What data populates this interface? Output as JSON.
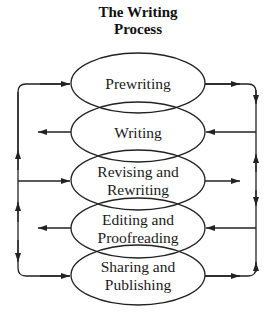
{
  "diagram": {
    "title_line1": "The Writing",
    "title_line2": "Process",
    "stages": [
      {
        "id": "prewriting",
        "line1": "Prewriting",
        "line2": ""
      },
      {
        "id": "writing",
        "line1": "Writing",
        "line2": ""
      },
      {
        "id": "revising",
        "line1": "Revising and",
        "line2": "Rewriting"
      },
      {
        "id": "editing",
        "line1": "Editing and",
        "line2": "Proofreading"
      },
      {
        "id": "sharing",
        "line1": "Sharing and",
        "line2": "Publishing"
      }
    ],
    "connections": {
      "left_loop": "bidirectional feedback line on left connecting all stages",
      "right_loop": "bidirectional feedback line on right connecting all stages"
    },
    "colors": {
      "line": "#222222",
      "background": "#ffffff"
    }
  }
}
